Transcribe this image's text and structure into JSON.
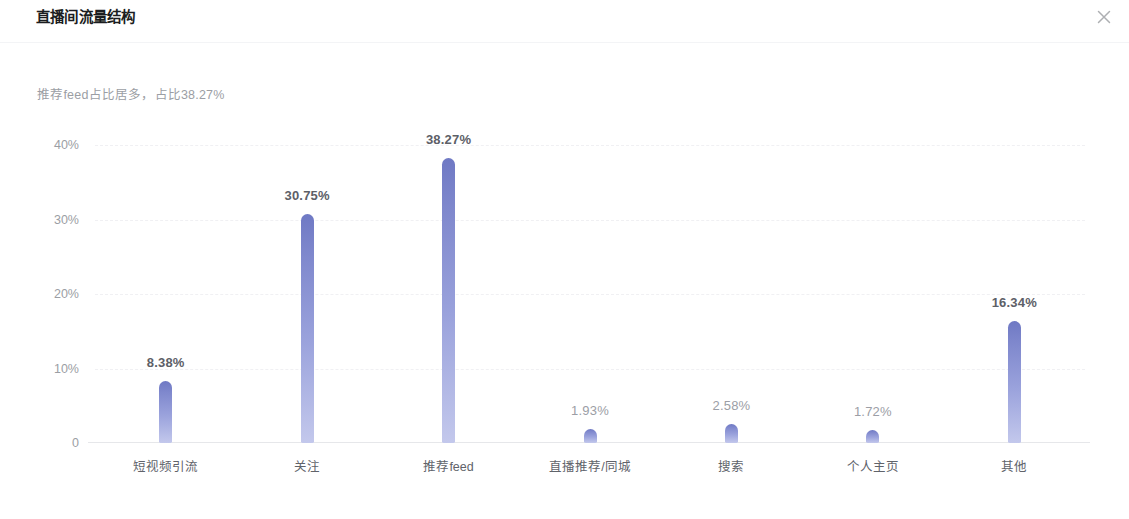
{
  "header": {
    "title": "直播间流量结构",
    "close_icon": "close-icon"
  },
  "subtitle": "推荐feed占比居多，占比38.27%",
  "colors": {
    "bar_top": "#6f79c4",
    "bar_bottom": "#c3c8ec",
    "axis": "#e6e7ea",
    "grid": "#f0f0f3",
    "tick_text": "#9b9ea4",
    "label_text": "#60636a"
  },
  "chart_data": {
    "type": "bar",
    "title": "直播间流量结构",
    "subtitle": "推荐feed占比居多，占比38.27%",
    "xlabel": "",
    "ylabel": "",
    "ylim": [
      0,
      40
    ],
    "grid": true,
    "legend": "none",
    "categories": [
      "短视频引流",
      "关注",
      "推荐feed",
      "直播推荐/同城",
      "搜索",
      "个人主页",
      "其他"
    ],
    "values": [
      8.38,
      30.75,
      38.27,
      1.93,
      2.58,
      1.72,
      16.34
    ],
    "data_labels": [
      "8.38%",
      "30.75%",
      "38.27%",
      "1.93%",
      "2.58%",
      "1.72%",
      "16.34%"
    ],
    "yticks": [
      {
        "value": 40,
        "label": "40%"
      },
      {
        "value": 30,
        "label": "30%"
      },
      {
        "value": 20,
        "label": "20%"
      },
      {
        "value": 10,
        "label": "10%"
      },
      {
        "value": 0,
        "label": "0"
      }
    ]
  }
}
